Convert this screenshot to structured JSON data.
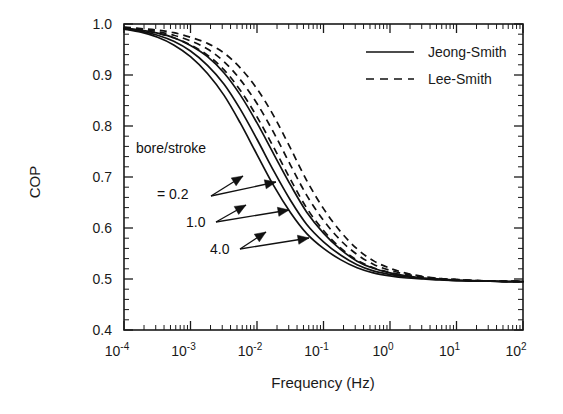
{
  "chart_data": {
    "type": "line",
    "title": "",
    "xlabel": "Frequency (Hz)",
    "ylabel": "COP",
    "xscale": "log",
    "yscale": "linear",
    "xlim": [
      0.0001,
      100
    ],
    "ylim": [
      0.4,
      1.0
    ],
    "grid": false,
    "legend_position": "top-right",
    "x_tick_labels": [
      "10-4",
      "10-3",
      "10-2",
      "10-1",
      "100",
      "101",
      "102"
    ],
    "x_tick_mantissas": [
      "10",
      "10",
      "10",
      "10",
      "10",
      "10",
      "10"
    ],
    "x_tick_exponents": [
      "-4",
      "-3",
      "-2",
      "-1",
      "0",
      "1",
      "2"
    ],
    "x_tick_values": [
      0.0001,
      0.001,
      0.01,
      0.1,
      1,
      10,
      100
    ],
    "y_tick_labels": [
      "0.4",
      "0.5",
      "0.6",
      "0.7",
      "0.8",
      "0.9",
      "1.0"
    ],
    "y_tick_values": [
      0.4,
      0.5,
      0.6,
      0.7,
      0.8,
      0.9,
      1.0
    ],
    "legend": [
      {
        "name": "Jeong-Smith",
        "style": "solid"
      },
      {
        "name": "Lee-Smith",
        "style": "dashed"
      }
    ],
    "annotations": [
      {
        "label": "bore/stroke",
        "x": 0.00042,
        "y": 0.762
      },
      {
        "label": "= 0.2",
        "x": 0.00062,
        "y": 0.706
      },
      {
        "label": "1.0",
        "x": 0.0018,
        "y": 0.661
      },
      {
        "label": "4.0",
        "x": 0.0032,
        "y": 0.621
      }
    ],
    "series": [
      {
        "name": "Jeong-Smith bore/stroke = 0.2",
        "model": "Jeong-Smith",
        "bore_stroke": 0.2,
        "style": "solid",
        "x": [
          0.0001,
          0.00018,
          0.00032,
          0.00056,
          0.001,
          0.0018,
          0.0032,
          0.0056,
          0.01,
          0.018,
          0.032,
          0.056,
          0.1,
          0.18,
          0.32,
          0.56,
          1.0,
          1.8,
          3.2,
          5.6,
          10,
          18,
          32,
          56,
          100
        ],
        "y": [
          0.99,
          0.984,
          0.974,
          0.959,
          0.936,
          0.903,
          0.86,
          0.806,
          0.744,
          0.682,
          0.63,
          0.589,
          0.56,
          0.538,
          0.522,
          0.512,
          0.506,
          0.502,
          0.5,
          0.498,
          0.497,
          0.496,
          0.496,
          0.495,
          0.495
        ]
      },
      {
        "name": "Jeong-Smith bore/stroke = 1.0",
        "model": "Jeong-Smith",
        "bore_stroke": 1.0,
        "style": "solid",
        "x": [
          0.0001,
          0.00018,
          0.00032,
          0.00056,
          0.001,
          0.0018,
          0.0032,
          0.0056,
          0.01,
          0.018,
          0.032,
          0.056,
          0.1,
          0.18,
          0.32,
          0.56,
          1.0,
          1.8,
          3.2,
          5.6,
          10,
          18,
          32,
          56,
          100
        ],
        "y": [
          0.991,
          0.986,
          0.978,
          0.966,
          0.947,
          0.919,
          0.882,
          0.833,
          0.774,
          0.711,
          0.654,
          0.607,
          0.573,
          0.547,
          0.528,
          0.516,
          0.509,
          0.504,
          0.501,
          0.499,
          0.497,
          0.496,
          0.496,
          0.495,
          0.495
        ]
      },
      {
        "name": "Jeong-Smith bore/stroke = 4.0",
        "model": "Jeong-Smith",
        "bore_stroke": 4.0,
        "style": "solid",
        "x": [
          0.0001,
          0.00018,
          0.00032,
          0.00056,
          0.001,
          0.0018,
          0.0032,
          0.0056,
          0.01,
          0.018,
          0.032,
          0.056,
          0.1,
          0.18,
          0.32,
          0.56,
          1.0,
          1.8,
          3.2,
          5.6,
          10,
          18,
          32,
          56,
          100
        ],
        "y": [
          0.992,
          0.988,
          0.982,
          0.973,
          0.958,
          0.936,
          0.904,
          0.861,
          0.806,
          0.744,
          0.684,
          0.631,
          0.59,
          0.558,
          0.535,
          0.521,
          0.512,
          0.506,
          0.502,
          0.5,
          0.498,
          0.497,
          0.496,
          0.495,
          0.495
        ]
      },
      {
        "name": "Lee-Smith bore/stroke = 0.2",
        "model": "Lee-Smith",
        "bore_stroke": 0.2,
        "style": "dashed",
        "x": [
          0.0001,
          0.00018,
          0.00032,
          0.00056,
          0.001,
          0.0018,
          0.0032,
          0.0056,
          0.01,
          0.018,
          0.032,
          0.056,
          0.1,
          0.18,
          0.32,
          0.56,
          1.0,
          1.8,
          3.2,
          5.6,
          10,
          18,
          32,
          56,
          100
        ],
        "y": [
          0.992,
          0.988,
          0.982,
          0.973,
          0.959,
          0.939,
          0.91,
          0.87,
          0.818,
          0.757,
          0.695,
          0.639,
          0.595,
          0.561,
          0.537,
          0.522,
          0.513,
          0.506,
          0.502,
          0.5,
          0.498,
          0.497,
          0.496,
          0.495,
          0.495
        ]
      },
      {
        "name": "Lee-Smith bore/stroke = 1.0",
        "model": "Lee-Smith",
        "bore_stroke": 1.0,
        "style": "dashed",
        "x": [
          0.0001,
          0.00018,
          0.00032,
          0.00056,
          0.001,
          0.0018,
          0.0032,
          0.0056,
          0.01,
          0.018,
          0.032,
          0.056,
          0.1,
          0.18,
          0.32,
          0.56,
          1.0,
          1.8,
          3.2,
          5.6,
          10,
          18,
          32,
          56,
          100
        ],
        "y": [
          0.993,
          0.99,
          0.985,
          0.978,
          0.967,
          0.951,
          0.926,
          0.891,
          0.844,
          0.786,
          0.723,
          0.664,
          0.615,
          0.576,
          0.548,
          0.529,
          0.517,
          0.509,
          0.504,
          0.501,
          0.499,
          0.497,
          0.496,
          0.496,
          0.495
        ]
      },
      {
        "name": "Lee-Smith bore/stroke = 4.0",
        "model": "Lee-Smith",
        "bore_stroke": 4.0,
        "style": "dashed",
        "x": [
          0.0001,
          0.00018,
          0.00032,
          0.00056,
          0.001,
          0.0018,
          0.0032,
          0.0056,
          0.01,
          0.018,
          0.032,
          0.056,
          0.1,
          0.18,
          0.32,
          0.56,
          1.0,
          1.8,
          3.2,
          5.6,
          10,
          18,
          32,
          56,
          100
        ],
        "y": [
          0.994,
          0.991,
          0.988,
          0.983,
          0.974,
          0.962,
          0.943,
          0.914,
          0.873,
          0.819,
          0.756,
          0.693,
          0.638,
          0.593,
          0.559,
          0.536,
          0.521,
          0.511,
          0.505,
          0.501,
          0.499,
          0.497,
          0.496,
          0.496,
          0.495
        ]
      }
    ]
  }
}
